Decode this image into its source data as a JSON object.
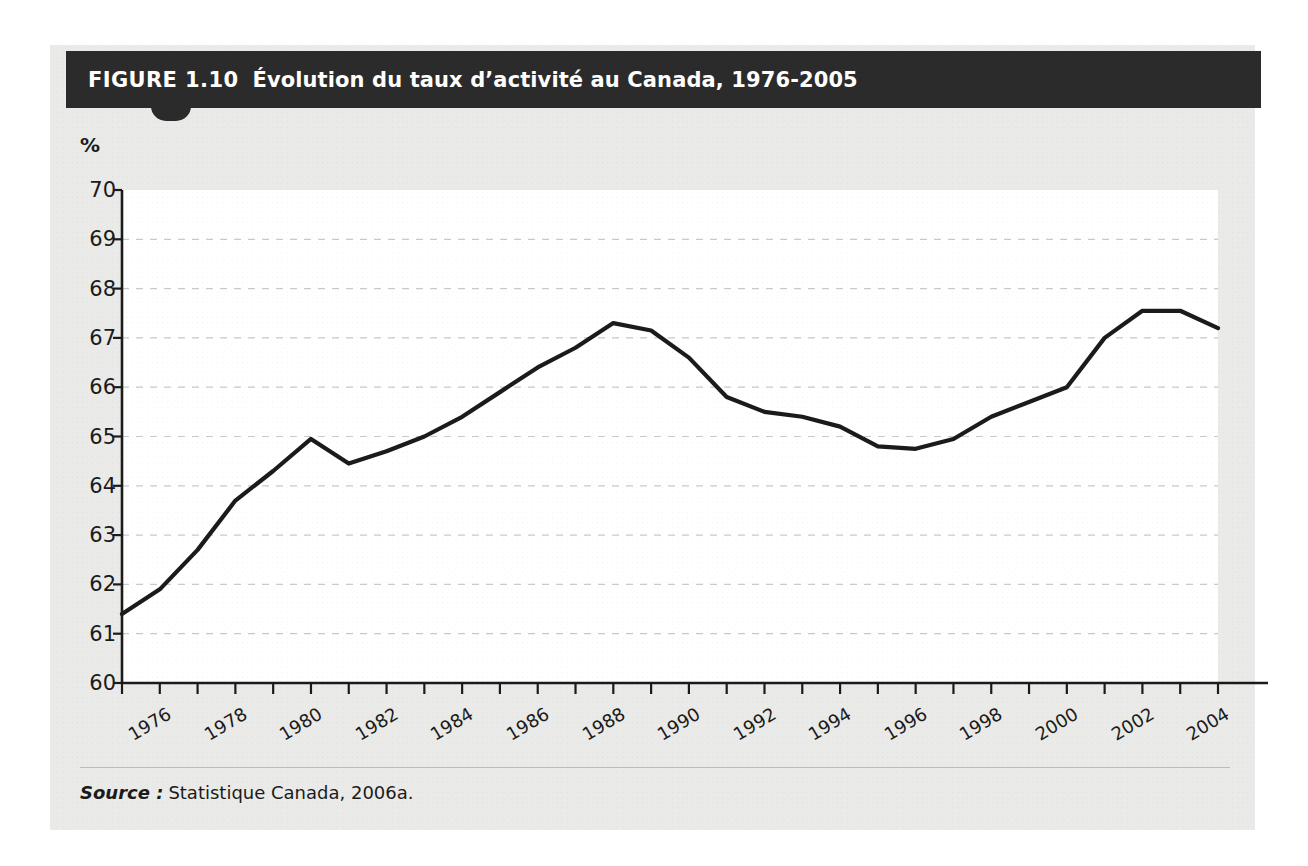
{
  "figure": {
    "number_label": "FIGURE 1.10",
    "title": "Évolution du taux d’activité au Canada, 1976-2005",
    "axis_unit": "%",
    "source_label": "Source :",
    "source_text": "Statistique Canada, 2006a."
  },
  "colors": {
    "banner_background": "#2b2b2b",
    "banner_text": "#ffffff",
    "card_background": "#eaeae8",
    "plot_background": "#ffffff",
    "line": "#1b1b1b",
    "gridline": "#c9c9cf",
    "axis": "#1b1b1b"
  },
  "chart_data": {
    "type": "line",
    "title": "Évolution du taux d’activité au Canada, 1976-2005",
    "xlabel": "",
    "ylabel": "%",
    "ylim": [
      60,
      70
    ],
    "xlim": [
      1976,
      2005
    ],
    "ytick_step": 1,
    "yticks": [
      60,
      61,
      62,
      63,
      64,
      65,
      66,
      67,
      68,
      69,
      70
    ],
    "ytick_labels": [
      "60",
      "61",
      "62",
      "63",
      "64",
      "65",
      "66",
      "67",
      "68",
      "69",
      "70"
    ],
    "xticks": [
      1976,
      1977,
      1978,
      1979,
      1980,
      1981,
      1982,
      1983,
      1984,
      1985,
      1986,
      1987,
      1988,
      1989,
      1990,
      1991,
      1992,
      1993,
      1994,
      1995,
      1996,
      1997,
      1998,
      1999,
      2000,
      2001,
      2002,
      2003,
      2004,
      2005
    ],
    "xtick_labels_shown": [
      "1976",
      "1978",
      "1980",
      "1982",
      "1984",
      "1986",
      "1988",
      "1990",
      "1992",
      "1994",
      "1996",
      "1998",
      "2000",
      "2002",
      "2004"
    ],
    "grid": "horizontal-dashed",
    "legend": "none",
    "x": [
      1976,
      1977,
      1978,
      1979,
      1980,
      1981,
      1982,
      1983,
      1984,
      1985,
      1986,
      1987,
      1988,
      1989,
      1990,
      1991,
      1992,
      1993,
      1994,
      1995,
      1996,
      1997,
      1998,
      1999,
      2000,
      2001,
      2002,
      2003,
      2004,
      2005
    ],
    "values": [
      61.4,
      61.9,
      62.7,
      63.7,
      64.3,
      64.95,
      64.45,
      64.7,
      65.0,
      65.4,
      65.9,
      66.4,
      66.8,
      67.3,
      67.15,
      66.6,
      65.8,
      65.5,
      65.4,
      65.2,
      64.8,
      64.75,
      64.95,
      65.4,
      65.7,
      66.0,
      67.0,
      67.55,
      67.55,
      67.2
    ],
    "series_name": "Taux d’activité",
    "annotations": []
  }
}
